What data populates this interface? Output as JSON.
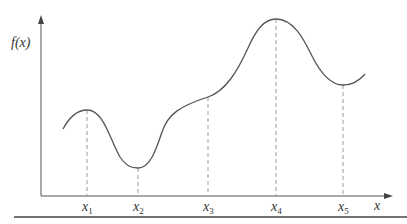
{
  "diagram": {
    "y_axis_label": "f(x)",
    "x_axis_label": "x",
    "points": [
      {
        "label": "x",
        "sub": "1",
        "px": 87,
        "py": 110,
        "kind": "local maximum"
      },
      {
        "label": "x",
        "sub": "2",
        "px": 138,
        "py": 168,
        "kind": "local minimum"
      },
      {
        "label": "x",
        "sub": "3",
        "px": 208,
        "py": 97,
        "kind": "inflection"
      },
      {
        "label": "x",
        "sub": "4",
        "px": 276,
        "py": 19,
        "kind": "global maximum"
      },
      {
        "label": "x",
        "sub": "5",
        "px": 343,
        "py": 85,
        "kind": "local minimum"
      }
    ],
    "colors": {
      "curve": "#555555",
      "axis": "#555555",
      "dashed": "#999999",
      "text": "#333333"
    }
  }
}
